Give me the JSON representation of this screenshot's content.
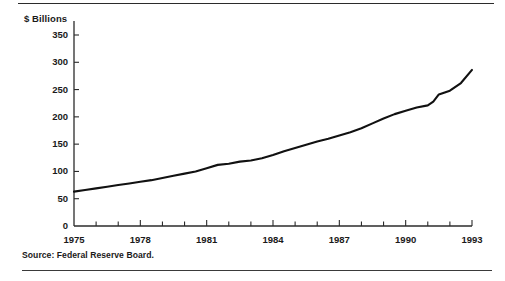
{
  "figure": {
    "axis_label_y": "$ Billions",
    "source_note": "Source:  Federal Reserve Board.",
    "line_color": "#111111",
    "axis_color": "#2b2b2b",
    "background_color": "#ffffff"
  },
  "chart_data": {
    "type": "line",
    "title": "",
    "subtitle": "",
    "xlabel": "",
    "ylabel": "$ Billions",
    "xlim": [
      1975,
      1993
    ],
    "ylim": [
      0,
      350
    ],
    "grid": false,
    "legend_position": "none",
    "y_ticks": [
      0,
      50,
      100,
      150,
      200,
      250,
      300,
      350
    ],
    "y_tick_labels": [
      "0",
      "50",
      "100",
      "150",
      "200",
      "250",
      "300",
      "350"
    ],
    "x_ticks": [
      1975,
      1976,
      1977,
      1978,
      1979,
      1980,
      1981,
      1982,
      1983,
      1984,
      1985,
      1986,
      1987,
      1988,
      1989,
      1990,
      1991,
      1992,
      1993
    ],
    "x_tick_labels_shown": [
      "1975",
      "1978",
      "1981",
      "1984",
      "1987",
      "1990",
      "1993"
    ],
    "x_labeled_ticks": [
      1975,
      1978,
      1981,
      1984,
      1987,
      1990,
      1993
    ],
    "annotations": [],
    "series": [
      {
        "name": "Currency in circulation",
        "x": [
          1975.0,
          1975.5,
          1976.0,
          1976.5,
          1977.0,
          1977.5,
          1978.0,
          1978.5,
          1979.0,
          1979.5,
          1980.0,
          1980.5,
          1981.0,
          1981.5,
          1982.0,
          1982.5,
          1983.0,
          1983.5,
          1984.0,
          1984.5,
          1985.0,
          1985.5,
          1986.0,
          1986.5,
          1987.0,
          1987.5,
          1988.0,
          1988.5,
          1989.0,
          1989.5,
          1990.0,
          1990.5,
          1991.0,
          1991.25,
          1991.5,
          1992.0,
          1992.5,
          1993.0
        ],
        "values": [
          63,
          66,
          69,
          72,
          75,
          78,
          81,
          84,
          88,
          92,
          96,
          100,
          106,
          112,
          114,
          118,
          120,
          124,
          130,
          137,
          143,
          149,
          155,
          160,
          166,
          172,
          179,
          188,
          197,
          205,
          211,
          217,
          221,
          228,
          241,
          248,
          262,
          286
        ]
      }
    ]
  }
}
